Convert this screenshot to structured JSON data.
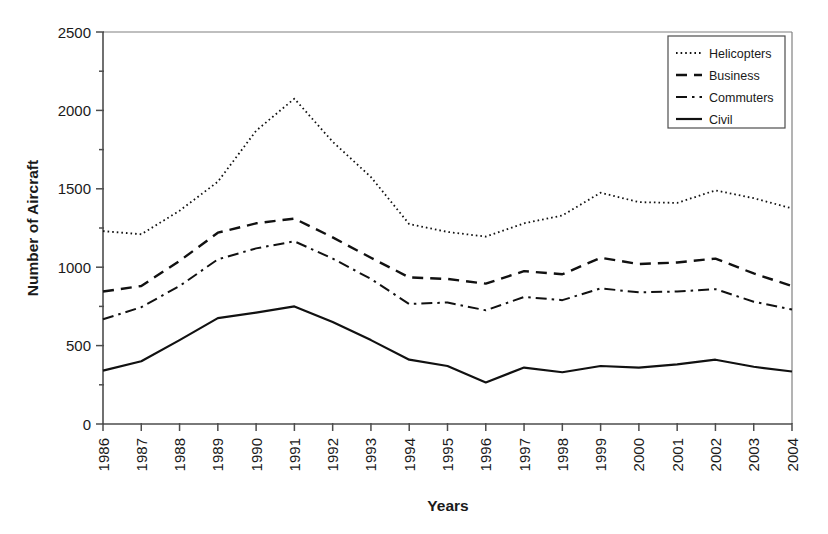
{
  "chart_data": {
    "type": "line",
    "title": "",
    "subtitle": "",
    "xlabel": "Years",
    "ylabel": "Number of Aircraft",
    "grid": false,
    "legend_position": "top-right",
    "xlim": [
      1986,
      2004
    ],
    "ylim": [
      0,
      2500
    ],
    "ytick_labels": [
      "0",
      "500",
      "1000",
      "1500",
      "2000",
      "2500"
    ],
    "yticks": [
      0,
      500,
      1000,
      1500,
      2000,
      2500
    ],
    "categories": [
      "1986",
      "1987",
      "1988",
      "1989",
      "1990",
      "1991",
      "1992",
      "1993",
      "1994",
      "1995",
      "1996",
      "1997",
      "1998",
      "1999",
      "2000",
      "2001",
      "2002",
      "2003",
      "2004"
    ],
    "x": [
      1986,
      1987,
      1988,
      1989,
      1990,
      1991,
      1992,
      1993,
      1994,
      1995,
      1996,
      1997,
      1998,
      1999,
      2000,
      2001,
      2002,
      2003,
      2004
    ],
    "series": [
      {
        "name": "Helicopters",
        "style": "dotted",
        "color": "#111111",
        "values": [
          1230,
          1210,
          1360,
          1545,
          1870,
          2075,
          1800,
          1575,
          1275,
          1225,
          1195,
          1280,
          1330,
          1475,
          1415,
          1410,
          1490,
          1440,
          1375
        ]
      },
      {
        "name": "Business",
        "style": "dashed",
        "color": "#111111",
        "values": [
          845,
          880,
          1040,
          1220,
          1280,
          1310,
          1190,
          1060,
          935,
          925,
          895,
          975,
          955,
          1060,
          1020,
          1030,
          1055,
          960,
          880
        ]
      },
      {
        "name": "Commuters",
        "style": "dashdot",
        "color": "#111111",
        "values": [
          668,
          745,
          880,
          1050,
          1120,
          1165,
          1055,
          925,
          765,
          775,
          725,
          810,
          790,
          865,
          840,
          845,
          860,
          780,
          730
        ]
      },
      {
        "name": "Civil",
        "style": "solid",
        "color": "#111111",
        "values": [
          340,
          400,
          535,
          675,
          710,
          750,
          650,
          535,
          410,
          370,
          265,
          360,
          330,
          370,
          360,
          380,
          410,
          365,
          335
        ]
      }
    ]
  },
  "axes": {
    "y_title": "Number of Aircraft",
    "x_title": "Years"
  },
  "legend": {
    "entries": [
      {
        "label": "Helicopters"
      },
      {
        "label": "Business"
      },
      {
        "label": "Commuters"
      },
      {
        "label": "Civil"
      }
    ]
  }
}
